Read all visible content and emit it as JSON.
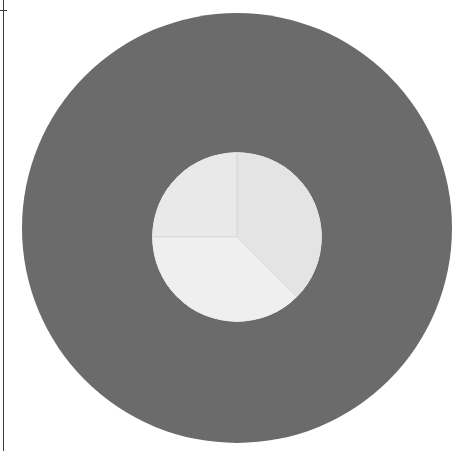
{
  "canvas": {
    "width": 460,
    "height": 451,
    "background": "#ffffff"
  },
  "frame": {
    "rule_color": "#3a3a3a",
    "vertical_rule_x": 3,
    "top_tick_y": 10
  },
  "outer_disc": {
    "label": "outer-disc",
    "color": "#6b6b6b",
    "center_x": 237,
    "center_y": 228,
    "radius": 215
  },
  "chart_data": {
    "type": "pie",
    "title": "",
    "subtitle": "",
    "xlabel": "",
    "ylabel": "",
    "grid": false,
    "legend": "none",
    "center_x": 237,
    "center_y": 237,
    "radius": 85,
    "start_angle_deg": 90,
    "direction": "counterclockwise",
    "edge_color": "#d8d8d8",
    "edge_width": 1,
    "labels": [
      "Slice 1",
      "Slice 2",
      "Slice 3"
    ],
    "values": [
      25,
      37.5,
      37.5
    ],
    "percentages": [
      "25%",
      "37.5%",
      "37.5%"
    ],
    "angles_deg": [
      90,
      135,
      135
    ],
    "colors": [
      "#e9e9e9",
      "#efefef",
      "#e4e4e4"
    ],
    "slices": [
      {
        "label": "Slice 1",
        "value": 25,
        "angle_deg": 90,
        "color": "#e9e9e9",
        "start_deg": 90,
        "end_deg": 180
      },
      {
        "label": "Slice 2",
        "value": 37.5,
        "angle_deg": 135,
        "color": "#efefef",
        "start_deg": 180,
        "end_deg": 315
      },
      {
        "label": "Slice 3",
        "value": 37.5,
        "angle_deg": 135,
        "color": "#e4e4e4",
        "start_deg": 315,
        "end_deg": 450
      }
    ]
  }
}
